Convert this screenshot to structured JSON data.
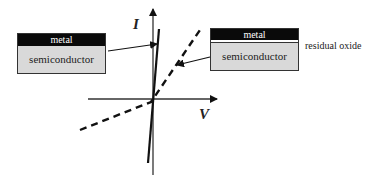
{
  "diagram": {
    "axes": {
      "x_label": "V",
      "y_label": "I"
    },
    "left_stack": {
      "top_layer": "metal",
      "bottom_layer": "semiconductor",
      "curve": "solid-steep-line"
    },
    "right_stack": {
      "top_layer": "metal",
      "interlayer": "residual oxide",
      "bottom_layer": "semiconductor",
      "curve": "dashed-shallow-line"
    },
    "annotation": "residual oxide",
    "colors": {
      "line": "#111111",
      "box_fill": "#d9d9d9",
      "header_fill": "#0a0a0a"
    }
  }
}
